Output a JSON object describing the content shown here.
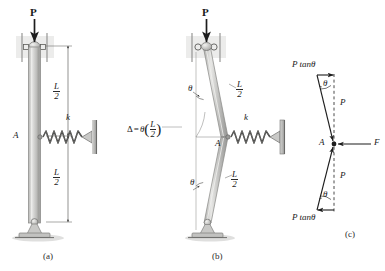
{
  "figure": {
    "background": "#ffffff",
    "ink": "#2b2b2b",
    "column_fill_light": "#d8d8d6",
    "column_fill_dark": "#a8a8a6",
    "shadow": "#cfcfcf"
  },
  "panel_a": {
    "caption": "(a)",
    "load_label": "P",
    "point_label": "A",
    "spring_label": "k",
    "dim_upper": {
      "numerator": "L",
      "denominator": "2"
    },
    "dim_lower": {
      "numerator": "L",
      "denominator": "2"
    },
    "description": "Straight column, pinned top and bottom, linear spring at midheight A"
  },
  "panel_b": {
    "caption": "(b)",
    "load_label": "P",
    "point_label": "A",
    "spring_label": "k",
    "angle_upper": "θ",
    "angle_lower": "θ",
    "dim_upper": {
      "numerator": "L",
      "denominator": "2"
    },
    "dim_lower": {
      "numerator": "L",
      "denominator": "2"
    },
    "deflection": {
      "symbol": "Δ",
      "equals": "=",
      "theta": "θ",
      "open_paren": "(",
      "numerator": "L",
      "denominator": "2",
      "close_paren": ")"
    },
    "description": "Buckled shape, two rigid segments rotated by theta, midpoint deflection"
  },
  "panel_c": {
    "caption": "(c)",
    "point_label": "A",
    "force_top_horizontal": "P tanθ",
    "force_bottom_horizontal": "P tanθ",
    "force_top_axial": "P",
    "force_bottom_axial": "P",
    "spring_force": "F",
    "angle_top": "θ",
    "angle_bottom": "θ",
    "description": "Free body diagram at joint A showing axial forces P, transverse components P tan theta and spring force F"
  }
}
